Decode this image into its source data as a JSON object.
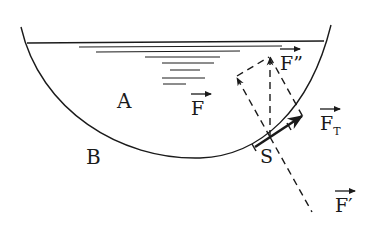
{
  "figure": {
    "title": "",
    "regions": [
      {
        "id": "A",
        "label": "A"
      },
      {
        "id": "B",
        "label": "B"
      }
    ],
    "point": {
      "label": "S"
    },
    "vectors": [
      {
        "id": "F",
        "label": "F",
        "arrow": true
      },
      {
        "id": "F_double_prime",
        "label": "F",
        "prime": "”"
      },
      {
        "id": "F_T",
        "label": "F",
        "subscript": "T"
      },
      {
        "id": "F_prime",
        "label": "F",
        "prime": "′"
      }
    ],
    "colors": {
      "ink": "#1a1a1a",
      "background": "#ffffff"
    }
  }
}
